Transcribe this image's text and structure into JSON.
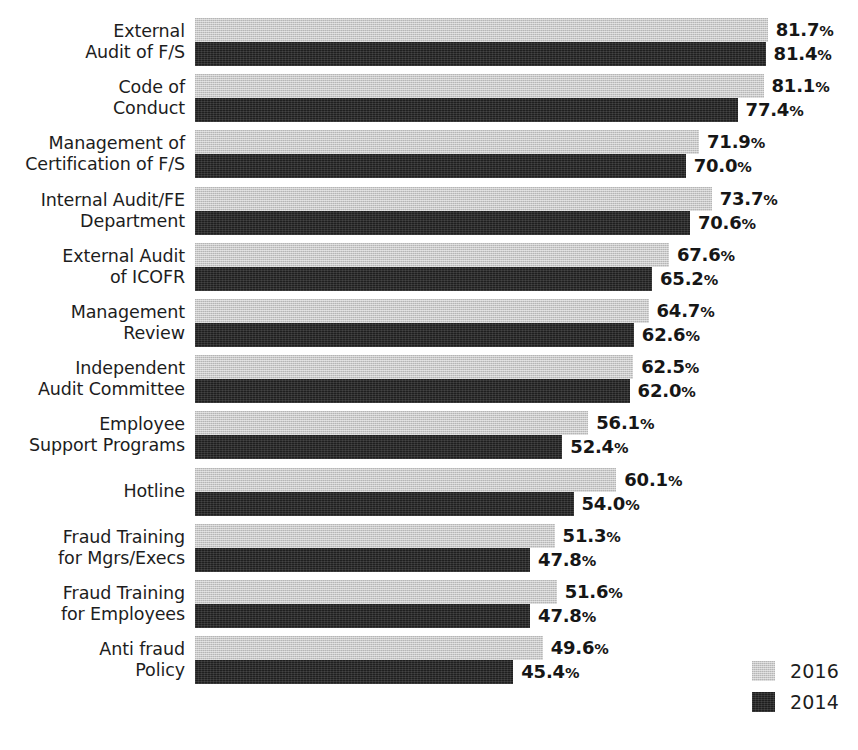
{
  "chart_data": {
    "type": "bar",
    "orientation": "horizontal",
    "title": "",
    "xlabel": "",
    "ylabel": "",
    "xlim": [
      0,
      100
    ],
    "grid": false,
    "value_suffix": "%",
    "legend_position": "bottom-right",
    "categories": [
      "External\nAudit of F/S",
      "Code of\nConduct",
      "Management of\nCertification of F/S",
      "Internal Audit/FE\nDepartment",
      "External Audit\nof ICOFR",
      "Management\nReview",
      "Independent\nAudit Committee",
      "Employee\nSupport Programs",
      "Hotline",
      "Fraud Training\nfor Mgrs/Execs",
      "Fraud Training\nfor Employees",
      "Anti fraud\nPolicy"
    ],
    "series": [
      {
        "name": "2016",
        "color": "#c9c9c9",
        "values": [
          81.7,
          81.1,
          71.9,
          73.7,
          67.6,
          64.7,
          62.5,
          56.1,
          60.1,
          51.3,
          51.6,
          49.6
        ],
        "labels": [
          "81.7%",
          "81.1%",
          "71.9%",
          "73.7%",
          "67.6%",
          "64.7%",
          "62.5%",
          "56.1%",
          "60.1%",
          "51.3%",
          "51.6%",
          "49.6%"
        ]
      },
      {
        "name": "2014",
        "color": "#1f1f1f",
        "values": [
          81.4,
          77.4,
          70.0,
          70.6,
          65.2,
          62.6,
          62.0,
          52.4,
          54.0,
          47.8,
          47.8,
          45.4
        ],
        "labels": [
          "81.4%",
          "77.4%",
          "70.0%",
          "70.6%",
          "65.2%",
          "62.6%",
          "62.0%",
          "52.4%",
          "54.0%",
          "47.8%",
          "47.8%",
          "45.4%"
        ]
      }
    ]
  },
  "legend": {
    "items": [
      {
        "label": "2016",
        "color": "#c9c9c9"
      },
      {
        "label": "2014",
        "color": "#1f1f1f"
      }
    ]
  }
}
